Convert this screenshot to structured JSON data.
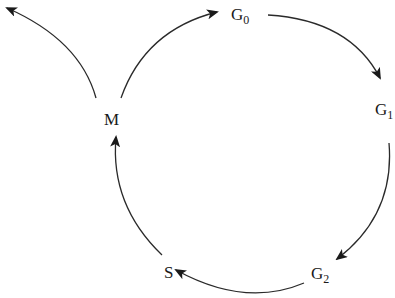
{
  "diagram": {
    "nodes": [
      {
        "id": "M",
        "label": "M",
        "sub": ""
      },
      {
        "id": "G0",
        "label": "G",
        "sub": "0"
      },
      {
        "id": "G1",
        "label": "G",
        "sub": "1"
      },
      {
        "id": "G2",
        "label": "G",
        "sub": "2"
      },
      {
        "id": "S",
        "label": "S",
        "sub": ""
      }
    ],
    "edges": [
      {
        "from": "M",
        "to": "G0"
      },
      {
        "from": "M",
        "to": "exit"
      },
      {
        "from": "G0",
        "to": "G1"
      },
      {
        "from": "G1",
        "to": "G2"
      },
      {
        "from": "G2",
        "to": "S"
      },
      {
        "from": "S",
        "to": "M"
      }
    ],
    "colors": {
      "line": "#2a2a2a",
      "text": "#1a1a1a",
      "background": "#ffffff"
    }
  }
}
